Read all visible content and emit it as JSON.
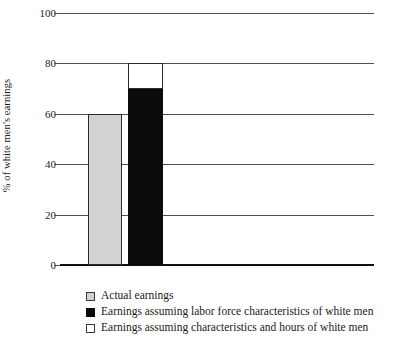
{
  "chart_data": {
    "type": "bar",
    "title": "",
    "xlabel": "",
    "ylabel": "% of white men's earnings",
    "ylim": [
      0,
      100
    ],
    "yticks": [
      0,
      20,
      40,
      60,
      80,
      100
    ],
    "ytick_labels": [
      "0",
      "20",
      "40",
      "60",
      "80",
      "100"
    ],
    "grid": true,
    "legend_position": "below",
    "categories": [
      ""
    ],
    "series": [
      {
        "name": "Actual earnings",
        "swatch": "sw-gray",
        "color": "#d2d2d2",
        "values": [
          60
        ],
        "stacked": false
      },
      {
        "name": "Earnings assuming labor force characteristics of white men",
        "swatch": "sw-black",
        "color": "#0b0b0b",
        "values": [
          70
        ],
        "stacked": true
      },
      {
        "name": "Earnings assuming characteristics and hours of white men",
        "swatch": "sw-white",
        "color": "#ffffff",
        "values": [
          80
        ],
        "stacked": true
      }
    ],
    "bars": [
      {
        "name": "actual-earnings-bar",
        "label": "Actual earnings",
        "bottom": 0,
        "top": 60,
        "fill": "#d2d2d2",
        "style": "seg-actual"
      },
      {
        "name": "labor-force-characteristics-bar",
        "label": "Earnings assuming labor force characteristics of white men",
        "bottom": 0,
        "top": 70,
        "fill": "#0b0b0b",
        "style": "seg-lfc"
      },
      {
        "name": "characteristics-and-hours-bar",
        "label": "Earnings assuming characteristics and hours of white men",
        "bottom": 70,
        "top": 80,
        "fill": "#ffffff",
        "style": "seg-hours"
      }
    ]
  },
  "axis": {
    "y_title": "% of white men's earnings",
    "ticks": [
      {
        "value": 100,
        "label": "100"
      },
      {
        "value": 80,
        "label": "80"
      },
      {
        "value": 60,
        "label": "60"
      },
      {
        "value": 40,
        "label": "40"
      },
      {
        "value": 20,
        "label": "20"
      },
      {
        "value": 0,
        "label": "0"
      }
    ]
  },
  "legend": {
    "items": [
      {
        "swatch": "sw-gray",
        "label": "Actual earnings"
      },
      {
        "swatch": "sw-black",
        "label": "Earnings assuming labor force characteristics of white men"
      },
      {
        "swatch": "sw-white",
        "label": "Earnings assuming characteristics and hours of white men"
      }
    ]
  },
  "colors": {
    "actual": "#d2d2d2",
    "labor_force": "#0b0b0b",
    "hours": "#ffffff",
    "gridline": "#4f4f4f",
    "axis": "#111111",
    "text": "#1a1a1a",
    "background": "#ffffff"
  }
}
